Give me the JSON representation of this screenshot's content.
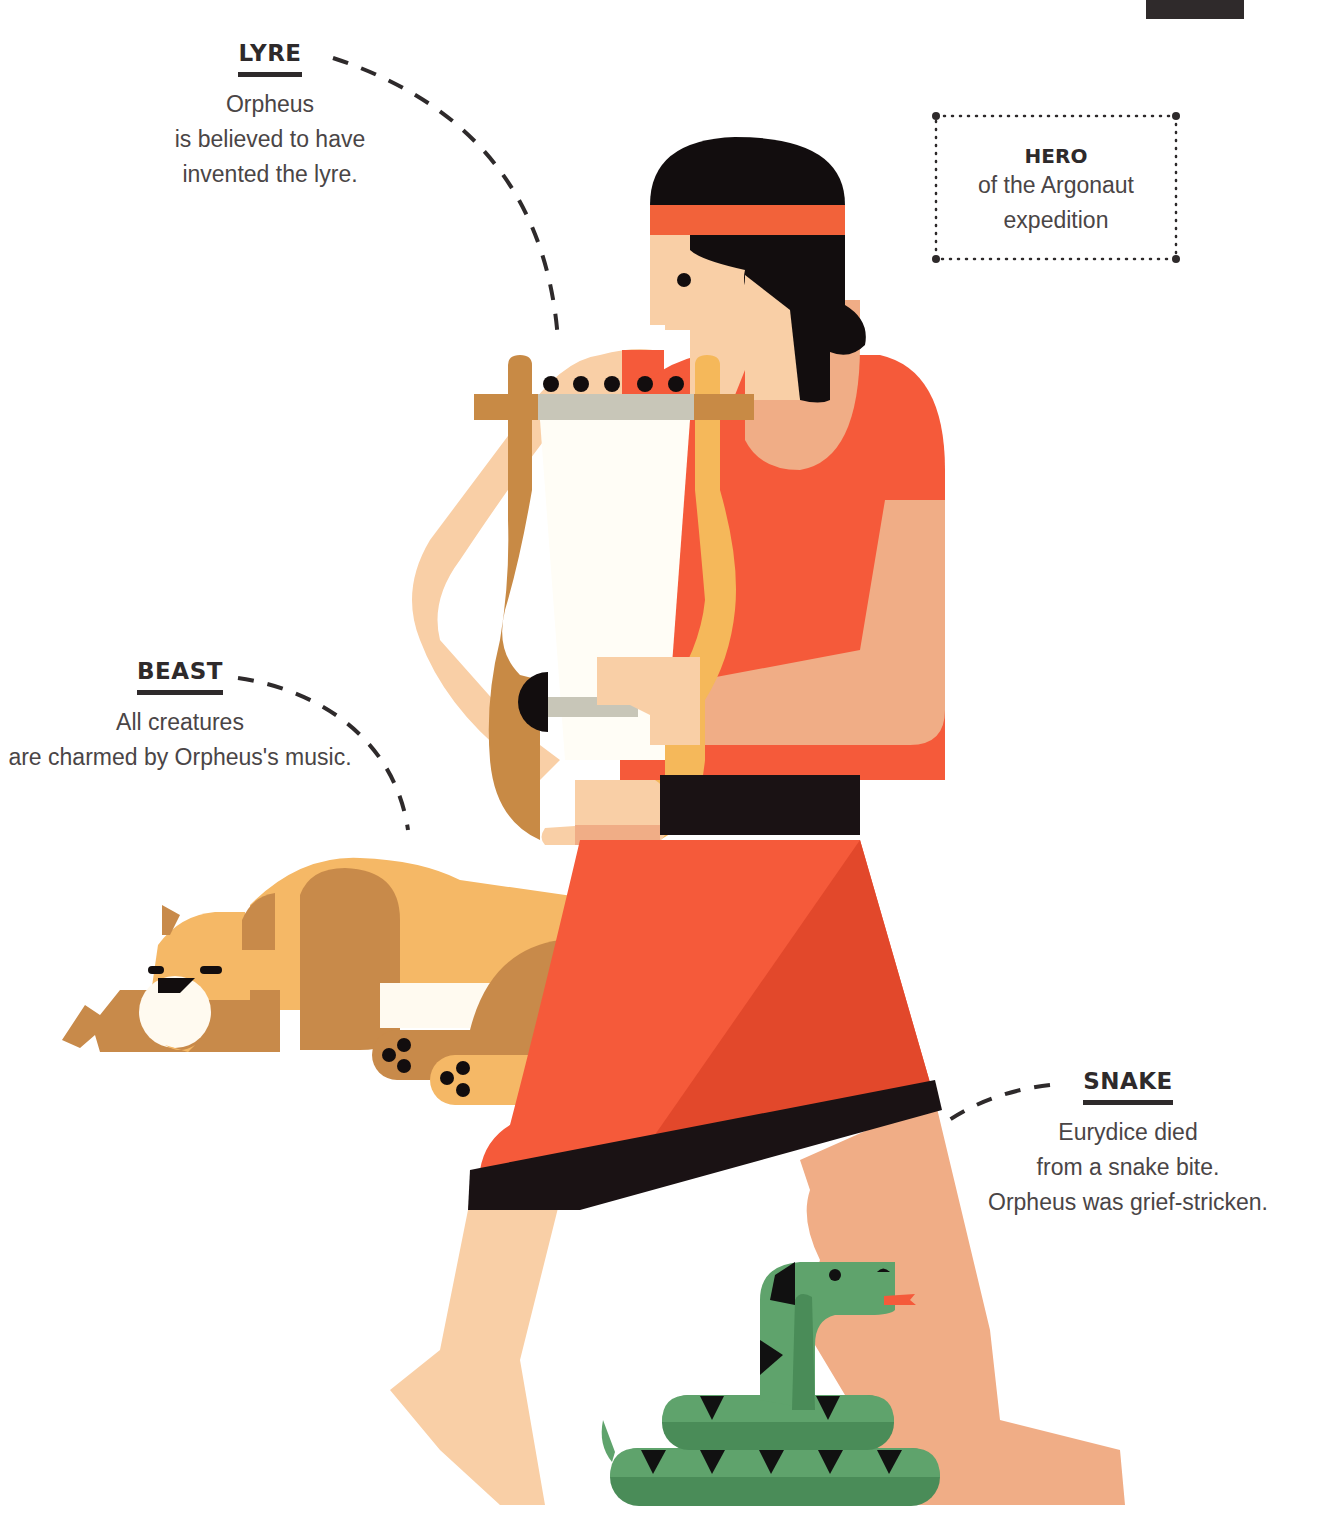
{
  "callouts": {
    "lyre": {
      "title": "LYRE",
      "lines": [
        "Orpheus",
        "is believed to have",
        "invented the lyre."
      ]
    },
    "hero": {
      "title": "HERO",
      "lines": [
        "of the Argonaut",
        "expedition"
      ]
    },
    "beast": {
      "title": "BEAST",
      "lines": [
        "All creatures",
        "are charmed by Orpheus's music."
      ]
    },
    "snake": {
      "title": "SNAKE",
      "lines": [
        "Eurydice died",
        "from a snake bite.",
        "Orpheus was grief-stricken."
      ]
    }
  },
  "palette": {
    "hair": "#120d0e",
    "headband": "#f2623a",
    "skin_light": "#f9cfa6",
    "skin_mid": "#f0ad86",
    "tunic": "#f55a3a",
    "tunic_shadow": "#e2482b",
    "belt": "#1a1214",
    "lyre_dark": "#c88a45",
    "lyre_light": "#f5b85a",
    "lyre_bar": "#c8c6b8",
    "lyre_sound": "#fffdf6",
    "lion_light": "#f5b866",
    "lion_dark": "#c88a4a",
    "lion_white": "#fffaf0",
    "snake_light": "#5fa36c",
    "snake_dark": "#4a8c58",
    "snake_marks": "#111111",
    "tongue": "#f55a3a",
    "text": "#4a4546",
    "title": "#2e2a2b"
  }
}
